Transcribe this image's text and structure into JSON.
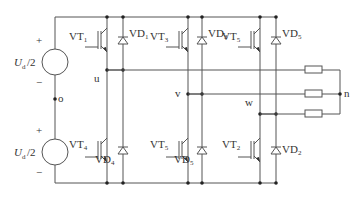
{
  "sources": [
    {
      "label": "U",
      "sub": "d",
      "suffix": "/2",
      "plus": "+",
      "minus": "−"
    },
    {
      "label": "U",
      "sub": "d",
      "suffix": "/2",
      "plus": "+",
      "minus": "−"
    }
  ],
  "midpoint": "o",
  "upper": [
    {
      "vt": "VT",
      "vt_sub": "1",
      "vd": "VD",
      "vd_sub": "1"
    },
    {
      "vt": "VT",
      "vt_sub": "3",
      "vd": "VD",
      "vd_sub": "3"
    },
    {
      "vt": "VT",
      "vt_sub": "5",
      "vd": "VD",
      "vd_sub": "5"
    }
  ],
  "lower": [
    {
      "vt": "VT",
      "vt_sub": "4",
      "vd": "VD",
      "vd_sub": "4"
    },
    {
      "vt": "VT",
      "vt_sub": "5",
      "vd": "VD",
      "vd_sub": "5"
    },
    {
      "vt": "VT",
      "vt_sub": "2",
      "vd": "VD",
      "vd_sub": "2"
    }
  ],
  "phases": [
    "u",
    "v",
    "w"
  ],
  "neutral": "n"
}
